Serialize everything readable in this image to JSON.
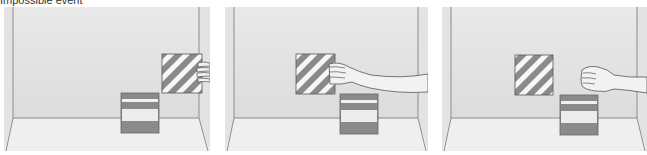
{
  "caption": "Impossible event",
  "colors": {
    "wall": "#e4e4e4",
    "floor": "#efefef",
    "edge": "#8c8c8c",
    "stripe_dark": "#8a8a8a",
    "stripe_light": "#f5f5f5",
    "skin": "#f2f2f2",
    "skin_outline": "#555555"
  },
  "panels": [
    {
      "id": "frame-1",
      "label": "Hand holds striped panel at right wall",
      "hand_state": "holding"
    },
    {
      "id": "frame-2",
      "label": "Arm extends holding striped panel mid-air",
      "hand_state": "holding"
    },
    {
      "id": "frame-3",
      "label": "Hand released; striped panel floats unsupported",
      "hand_state": "released"
    }
  ]
}
